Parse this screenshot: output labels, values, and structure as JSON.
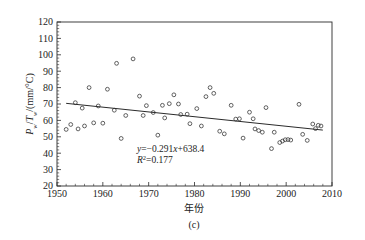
{
  "chart_data": {
    "type": "scatter",
    "title": "",
    "subtitle": "",
    "caption": "(c)",
    "xlabel": "年份",
    "ylabel": "P_w/T_w/(mm/°C)",
    "ylabel_parts": {
      "p": "P",
      "p_sub": "w",
      "slash1": "/",
      "t": "T",
      "t_sub": "w",
      "unit": "/(mm/°C)"
    },
    "xlim": [
      1950,
      2010
    ],
    "ylim": [
      20,
      120
    ],
    "xticks": [
      1950,
      1960,
      1970,
      1980,
      1990,
      2000,
      2010
    ],
    "yticks": [
      20,
      30,
      40,
      50,
      60,
      70,
      80,
      90,
      100,
      110,
      120
    ],
    "x_minor_step": 2,
    "y_minor_step": 2,
    "grid": false,
    "legend": "none",
    "marker_style": "open-circle",
    "annotations": [
      {
        "name": "regression-equation",
        "text": "y=−0.291x+638.4"
      },
      {
        "name": "r-squared",
        "text": "R²=0.177"
      }
    ],
    "trendline": {
      "name": "linear-trend",
      "slope": -0.291,
      "intercept": 638.4,
      "r_squared": 0.177,
      "x_start": 1952,
      "x_end": 2008,
      "y_start": 70.4,
      "y_end": 54.1
    },
    "points": [
      {
        "x": 1952,
        "y": 54.5
      },
      {
        "x": 1953,
        "y": 57.5
      },
      {
        "x": 1954,
        "y": 70.8
      },
      {
        "x": 1954.6,
        "y": 54.8
      },
      {
        "x": 1955.5,
        "y": 67.5
      },
      {
        "x": 1956,
        "y": 56.6
      },
      {
        "x": 1957,
        "y": 80.0
      },
      {
        "x": 1958,
        "y": 58.5
      },
      {
        "x": 1959,
        "y": 68.8
      },
      {
        "x": 1960,
        "y": 58.3
      },
      {
        "x": 1961,
        "y": 79.0
      },
      {
        "x": 1962.5,
        "y": 66.2
      },
      {
        "x": 1963,
        "y": 94.8
      },
      {
        "x": 1964,
        "y": 49.0
      },
      {
        "x": 1965,
        "y": 63.0
      },
      {
        "x": 1966.6,
        "y": 97.5
      },
      {
        "x": 1968,
        "y": 74.8
      },
      {
        "x": 1968.8,
        "y": 63.0
      },
      {
        "x": 1969.5,
        "y": 69.0
      },
      {
        "x": 1971,
        "y": 64.8
      },
      {
        "x": 1972,
        "y": 51.0
      },
      {
        "x": 1973,
        "y": 69.2
      },
      {
        "x": 1973.5,
        "y": 61.5
      },
      {
        "x": 1974.5,
        "y": 70.2
      },
      {
        "x": 1975.5,
        "y": 75.6
      },
      {
        "x": 1976.5,
        "y": 70.0
      },
      {
        "x": 1977,
        "y": 63.6
      },
      {
        "x": 1978.4,
        "y": 63.8
      },
      {
        "x": 1979,
        "y": 58.0
      },
      {
        "x": 1980.5,
        "y": 67.2
      },
      {
        "x": 1981.5,
        "y": 56.6
      },
      {
        "x": 1982.5,
        "y": 74.5
      },
      {
        "x": 1983.4,
        "y": 80.0
      },
      {
        "x": 1984.2,
        "y": 76.5
      },
      {
        "x": 1985.5,
        "y": 53.4
      },
      {
        "x": 1986.5,
        "y": 51.8
      },
      {
        "x": 1988,
        "y": 69.2
      },
      {
        "x": 1989,
        "y": 60.8
      },
      {
        "x": 1989.8,
        "y": 61.0
      },
      {
        "x": 1990.6,
        "y": 49.2
      },
      {
        "x": 1992,
        "y": 65.0
      },
      {
        "x": 1992.8,
        "y": 61.0
      },
      {
        "x": 1993.2,
        "y": 54.8
      },
      {
        "x": 1994,
        "y": 53.8
      },
      {
        "x": 1994.8,
        "y": 52.8
      },
      {
        "x": 1995.6,
        "y": 67.8
      },
      {
        "x": 1996.8,
        "y": 42.8
      },
      {
        "x": 1997.4,
        "y": 52.8
      },
      {
        "x": 1998.6,
        "y": 46.5
      },
      {
        "x": 1999.2,
        "y": 47.4
      },
      {
        "x": 1999.8,
        "y": 48.2
      },
      {
        "x": 2000.4,
        "y": 48.3
      },
      {
        "x": 2001,
        "y": 48.0
      },
      {
        "x": 2002.8,
        "y": 69.8
      },
      {
        "x": 2003.6,
        "y": 51.5
      },
      {
        "x": 2004.6,
        "y": 47.8
      },
      {
        "x": 2005.8,
        "y": 57.8
      },
      {
        "x": 2006.4,
        "y": 55.0
      },
      {
        "x": 2007,
        "y": 57.0
      },
      {
        "x": 2007.6,
        "y": 56.6
      }
    ]
  }
}
